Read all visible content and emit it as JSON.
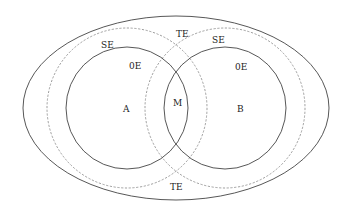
{
  "diagram": {
    "type": "venn",
    "colors": {
      "background": "#ffffff",
      "solid_stroke": "#444444",
      "dashed_stroke": "#888888",
      "text": "#222222"
    },
    "outer_ellipse": {
      "cx": 176,
      "cy": 108,
      "rx": 153,
      "ry": 92,
      "style": "solid"
    },
    "circles": [
      {
        "id": "A",
        "cx": 127,
        "cy": 108,
        "r": 61,
        "style": "solid"
      },
      {
        "id": "B",
        "cx": 225,
        "cy": 108,
        "r": 61,
        "style": "solid"
      },
      {
        "id": "SE-A",
        "cx": 127,
        "cy": 108,
        "r": 80,
        "style": "dashed"
      },
      {
        "id": "SE-B",
        "cx": 225,
        "cy": 108,
        "r": 80,
        "style": "dashed"
      }
    ],
    "labels": {
      "se_left": "SE",
      "oe_left": "0E",
      "a": "A",
      "m": "M",
      "b": "B",
      "te_top": "TE",
      "se_right": "SE",
      "oe_right": "0E",
      "te_bottom": "TE"
    }
  }
}
